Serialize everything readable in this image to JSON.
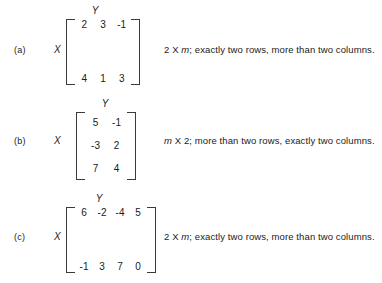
{
  "figure": {
    "column_variable_label": "Y",
    "row_variable_label": "X"
  },
  "items": [
    {
      "label": "(a)",
      "row_var": "X",
      "col_var": "Y",
      "matrix": [
        [
          "2",
          "3",
          "-1"
        ],
        [
          "4",
          "1",
          "3"
        ]
      ],
      "description": {
        "full": "2 X m; exactly two rows, more than two columns.",
        "dim_first": "2",
        "times": "X",
        "dim_second": "m",
        "dim_second_italic": true,
        "dim_first_italic": false,
        "detail": "; exactly two rows, more than two columns."
      }
    },
    {
      "label": "(b)",
      "row_var": "X",
      "col_var": "Y",
      "matrix": [
        [
          "5",
          "-1"
        ],
        [
          "-3",
          "2"
        ],
        [
          "7",
          "4"
        ]
      ],
      "description": {
        "full": "m X 2; more than two rows, exactly two columns.",
        "dim_first": "m",
        "times": "X",
        "dim_second": "2",
        "dim_second_italic": false,
        "dim_first_italic": true,
        "detail": "; more than two rows, exactly two columns."
      }
    },
    {
      "label": "(c)",
      "row_var": "X",
      "col_var": "Y",
      "matrix": [
        [
          "6",
          "-2",
          "-4",
          "5"
        ],
        [
          "-1",
          "3",
          "7",
          "0"
        ]
      ],
      "description": {
        "full": "2 X m; exactly two rows, more than two columns.",
        "dim_first": "2",
        "times": "X",
        "dim_second": "m",
        "dim_second_italic": true,
        "dim_first_italic": false,
        "detail": "; exactly two rows, more than two columns."
      }
    }
  ]
}
